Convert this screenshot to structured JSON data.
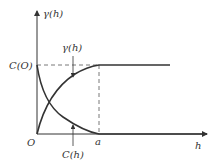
{
  "diagram": {
    "y_axis_label": "γ(h)",
    "x_axis_label": "h",
    "origin_label": "O",
    "sill_label": "C(O)",
    "range_label": "a",
    "curves": [
      {
        "name": "variogram",
        "label": "γ(h)",
        "shape": "increasing to sill at a, then flat"
      },
      {
        "name": "covariance",
        "label": "C(h)",
        "shape": "decreasing from C(O) to 0 at a, then flat"
      }
    ],
    "colors": {
      "line": "#333333",
      "dash": "#555555",
      "background": "#ffffff"
    }
  }
}
